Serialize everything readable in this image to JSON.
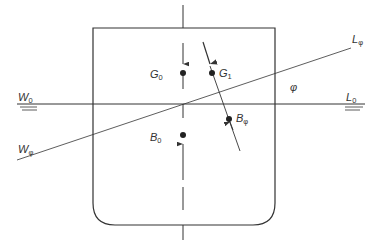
{
  "diagram": {
    "colors": {
      "stroke": "#333333",
      "background": "#ffffff"
    },
    "labels": {
      "w0": {
        "main": "W",
        "sub": "0"
      },
      "l0": {
        "main": "L",
        "sub": "0"
      },
      "wphi": {
        "main": "W",
        "sub": "φ"
      },
      "lphi": {
        "main": "L",
        "sub": "φ"
      },
      "g0": {
        "main": "G",
        "sub": "0"
      },
      "g1": {
        "main": "G",
        "sub": "1"
      },
      "b0": {
        "main": "B",
        "sub": "0"
      },
      "bphi": {
        "main": "B",
        "sub": "φ"
      },
      "phi": "φ"
    },
    "points": [
      {
        "id": "G0",
        "x": 183,
        "y": 73
      },
      {
        "id": "G1",
        "x": 212,
        "y": 73
      },
      {
        "id": "B0",
        "x": 183,
        "y": 135
      },
      {
        "id": "Bphi",
        "x": 229,
        "y": 119
      }
    ],
    "lines": {
      "upright_waterline": {
        "from": [
          17,
          104
        ],
        "to": [
          365,
          104
        ]
      },
      "heeled_waterline": {
        "from": [
          17,
          160
        ],
        "to": [
          351,
          48
        ]
      },
      "centreline_x": 183,
      "tilted_force_line": {
        "from": [
          203,
          42
        ],
        "to": [
          240,
          151
        ]
      }
    },
    "hull": {
      "left": 93,
      "right": 275,
      "top": 28,
      "bottom": 225,
      "corner_radius": 22
    }
  }
}
